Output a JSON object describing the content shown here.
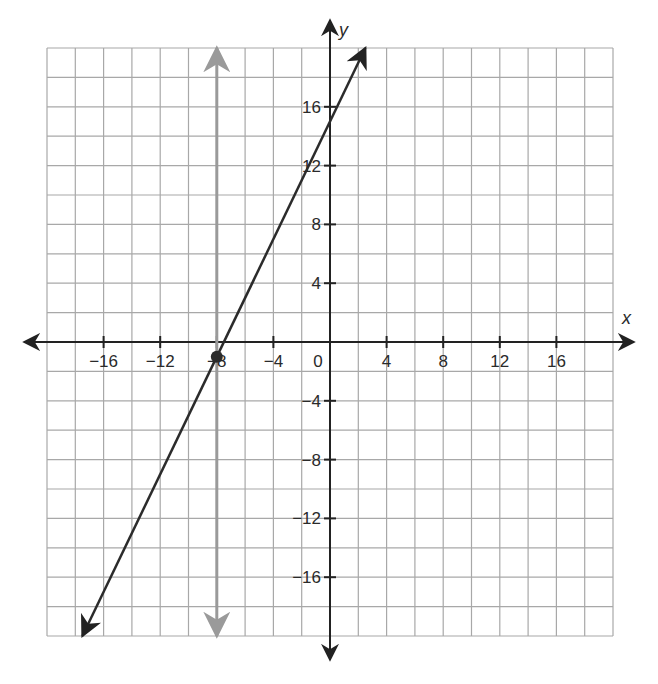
{
  "chart_data": {
    "type": "line",
    "title": "",
    "xlabel": "x",
    "ylabel": "y",
    "xlim": [
      -20,
      20
    ],
    "ylim": [
      -20,
      20
    ],
    "grid": true,
    "grid_step": 2,
    "x_ticks": [
      -16,
      -12,
      -8,
      -4,
      0,
      4,
      8,
      12,
      16
    ],
    "x_tick_labels": [
      "−16",
      "−12",
      "−8",
      "−4",
      "0",
      "4",
      "8",
      "12",
      "16"
    ],
    "y_ticks": [
      16,
      12,
      8,
      4,
      -4,
      -8,
      -12,
      -16
    ],
    "y_tick_labels": [
      "16",
      "12",
      "8",
      "4",
      "−4",
      "−8",
      "−12",
      "−16"
    ],
    "series": [
      {
        "name": "line y = 2x + 15",
        "kind": "line",
        "slope": 2,
        "intercept": 15,
        "x": [
          -17.5,
          2.5
        ],
        "y": [
          -20,
          20
        ],
        "color": "#2b2b2b",
        "arrows": true
      },
      {
        "name": "vertical line x = -8",
        "kind": "vertical",
        "x": [
          -8,
          -8
        ],
        "y": [
          -20,
          20
        ],
        "color": "#9a9a9a",
        "arrows": true
      },
      {
        "name": "point",
        "kind": "point",
        "x": [
          -8
        ],
        "y": [
          -1
        ],
        "color": "#2b2b2b"
      }
    ],
    "legend": null
  },
  "colors": {
    "grid": "#a8a8a8",
    "axis": "#222222",
    "line": "#2b2b2b",
    "vertical": "#9a9a9a"
  }
}
